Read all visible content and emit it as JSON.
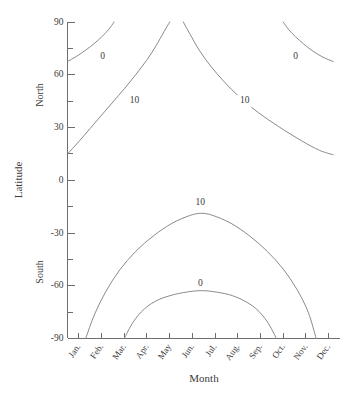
{
  "figure": {
    "background_color": "#ffffff",
    "line_color": "#8a8a8a",
    "axis_color": "#6e6e6e",
    "text_color": "#3a3a3a"
  },
  "axes": {
    "x_title": "Month",
    "y_title": "Latitude",
    "hemisphere_north": "North",
    "hemisphere_south": "South"
  },
  "chart_data": {
    "type": "line",
    "title": "",
    "subtitle": "",
    "xlabel": "Month",
    "ylabel": "Latitude",
    "grid": false,
    "legend": "none",
    "annotations": [
      "0",
      "10",
      "10",
      "0",
      "10",
      "0"
    ],
    "x": [
      "Jan.",
      "Feb.",
      "Mar.",
      "Apr.",
      "May",
      "Jun.",
      "Jul.",
      "Aug.",
      "Sep.",
      "Oct.",
      "Nov.",
      "Dec."
    ],
    "xlim": [
      0.5,
      12.5
    ],
    "ylim": [
      -90,
      90
    ],
    "xtick_labels": [
      "Jan.",
      "Feb.",
      "Mar.",
      "Apr.",
      "May",
      "Jun.",
      "Jul.",
      "Aug.",
      "Sep.",
      "Oct.",
      "Nov.",
      "Dec."
    ],
    "ytick_labels": [
      "90",
      "60",
      "30",
      "0",
      "-30",
      "-60",
      "-90"
    ],
    "ytick_values": [
      90,
      60,
      30,
      0,
      -30,
      -60,
      -90
    ],
    "ytick_minor_values": [
      75,
      45,
      15,
      -15,
      -45,
      -75
    ],
    "series": [
      {
        "name": "0 (north, early year)",
        "label": "0",
        "label_x": 2.05,
        "label_y": 70,
        "points": [
          [
            0.5,
            67.5
          ],
          [
            0.9,
            70.5
          ],
          [
            1.3,
            74.0
          ],
          [
            1.7,
            78.0
          ],
          [
            2.0,
            81.5
          ],
          [
            2.3,
            85.5
          ],
          [
            2.55,
            90.0
          ]
        ]
      },
      {
        "name": "10 (north, rising)",
        "label": "10",
        "label_x": 3.45,
        "label_y": 45,
        "points": [
          [
            0.5,
            15.0
          ],
          [
            1.0,
            22.0
          ],
          [
            1.5,
            29.5
          ],
          [
            2.0,
            37.0
          ],
          [
            2.5,
            44.5
          ],
          [
            3.0,
            52.0
          ],
          [
            3.5,
            60.0
          ],
          [
            4.0,
            68.5
          ],
          [
            4.4,
            76.5
          ],
          [
            4.75,
            84.5
          ],
          [
            5.0,
            90.0
          ]
        ]
      },
      {
        "name": "10 (north, falling)",
        "label": "10",
        "label_x": 8.3,
        "label_y": 45,
        "points": [
          [
            5.6,
            90.0
          ],
          [
            5.9,
            83.0
          ],
          [
            6.3,
            74.0
          ],
          [
            6.8,
            65.0
          ],
          [
            7.4,
            56.0
          ],
          [
            8.1,
            47.0
          ],
          [
            8.9,
            38.5
          ],
          [
            9.8,
            30.5
          ],
          [
            10.8,
            22.5
          ],
          [
            11.6,
            17.0
          ],
          [
            12.2,
            14.5
          ]
        ]
      },
      {
        "name": "0 (north, late year)",
        "label": "0",
        "label_x": 10.55,
        "label_y": 70,
        "points": [
          [
            10.0,
            90.0
          ],
          [
            10.25,
            85.5
          ],
          [
            10.55,
            81.5
          ],
          [
            10.9,
            77.5
          ],
          [
            11.3,
            73.5
          ],
          [
            11.75,
            70.0
          ],
          [
            12.2,
            67.5
          ]
        ]
      },
      {
        "name": "10 (south arch)",
        "label": "10",
        "label_x": 6.35,
        "label_y": -13,
        "points": [
          [
            1.3,
            -90.0
          ],
          [
            1.7,
            -76.0
          ],
          [
            2.2,
            -63.0
          ],
          [
            2.8,
            -51.0
          ],
          [
            3.5,
            -40.5
          ],
          [
            4.3,
            -31.5
          ],
          [
            5.1,
            -24.5
          ],
          [
            5.9,
            -20.0
          ],
          [
            6.4,
            -18.8
          ],
          [
            6.9,
            -20.0
          ],
          [
            7.7,
            -24.5
          ],
          [
            8.5,
            -31.5
          ],
          [
            9.3,
            -40.5
          ],
          [
            10.0,
            -50.5
          ],
          [
            10.6,
            -62.0
          ],
          [
            11.1,
            -75.0
          ],
          [
            11.45,
            -90.0
          ]
        ]
      },
      {
        "name": "0 (south arch)",
        "label": "0",
        "label_x": 6.35,
        "label_y": -59,
        "points": [
          [
            3.0,
            -90.0
          ],
          [
            3.4,
            -80.5
          ],
          [
            3.9,
            -73.0
          ],
          [
            4.5,
            -68.0
          ],
          [
            5.2,
            -65.0
          ],
          [
            5.9,
            -63.3
          ],
          [
            6.4,
            -62.8
          ],
          [
            6.9,
            -63.3
          ],
          [
            7.6,
            -65.0
          ],
          [
            8.2,
            -68.0
          ],
          [
            8.8,
            -73.0
          ],
          [
            9.3,
            -80.5
          ],
          [
            9.7,
            -90.0
          ]
        ]
      }
    ]
  }
}
